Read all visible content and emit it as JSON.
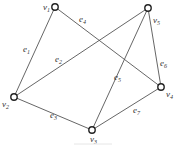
{
  "graph": {
    "nodes": [
      {
        "id": "v1",
        "label": "v",
        "sub": "1",
        "x": 55,
        "y": 7,
        "lx": 43,
        "ly": 10
      },
      {
        "id": "v2",
        "label": "v",
        "sub": "2",
        "x": 14,
        "y": 97,
        "lx": 2,
        "ly": 107
      },
      {
        "id": "v3",
        "label": "v",
        "sub": "3",
        "x": 92,
        "y": 130,
        "lx": 90,
        "ly": 142
      },
      {
        "id": "v4",
        "label": "v",
        "sub": "4",
        "x": 161,
        "y": 87,
        "lx": 166,
        "ly": 97
      },
      {
        "id": "v5",
        "label": "v",
        "sub": "5",
        "x": 148,
        "y": 8,
        "lx": 153,
        "ly": 23
      }
    ],
    "edges": [
      {
        "id": "e1",
        "label": "e",
        "sub": "1",
        "from": "v1",
        "to": "v2",
        "lx": 23,
        "ly": 52
      },
      {
        "id": "e2",
        "label": "e",
        "sub": "2",
        "from": "v2",
        "to": "v5",
        "lx": 55,
        "ly": 62
      },
      {
        "id": "e3",
        "label": "e",
        "sub": "3",
        "from": "v2",
        "to": "v3",
        "lx": 50,
        "ly": 118
      },
      {
        "id": "e4",
        "label": "e",
        "sub": "4",
        "from": "v1",
        "to": "v4",
        "lx": 79,
        "ly": 22
      },
      {
        "id": "e5",
        "label": "e",
        "sub": "5",
        "from": "v3",
        "to": "v5",
        "lx": 114,
        "ly": 80
      },
      {
        "id": "e6",
        "label": "e",
        "sub": "6",
        "from": "v5",
        "to": "v4",
        "lx": 160,
        "ly": 66
      },
      {
        "id": "e7",
        "label": "e",
        "sub": "7",
        "from": "v3",
        "to": "v4",
        "lx": 133,
        "ly": 113
      }
    ]
  }
}
